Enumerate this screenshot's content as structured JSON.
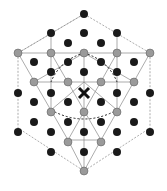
{
  "diagram": {
    "type": "crystal-lattice",
    "caption": "",
    "colors": {
      "dark_atom": "#1a1a1a",
      "grey_atom": "#9a9a9a",
      "line": "#777777",
      "dashed": "#333333"
    },
    "center_marker": "X"
  }
}
